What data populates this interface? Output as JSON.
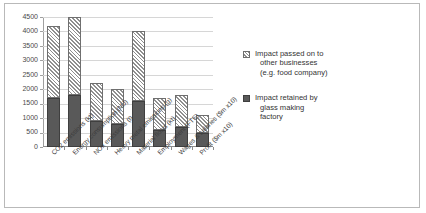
{
  "chart_data": {
    "type": "bar",
    "title": "",
    "subtitle": "",
    "xlabel": "",
    "ylabel": "",
    "stacked": true,
    "grid": true,
    "legend_position": "right",
    "ylim": [
      0,
      4500
    ],
    "yticks": [
      0,
      500,
      1000,
      1500,
      2000,
      2500,
      3000,
      3500,
      4000,
      4500
    ],
    "ytick_labels": [
      "0",
      "500",
      "1000",
      "1500",
      "2000",
      "2500",
      "3000",
      "3500",
      "4000",
      "4500"
    ],
    "categories": [
      "CO2 emissions (kt)",
      "Energy consumption (MJ)",
      "NOx emissions (t)",
      "Heavy metal emissions (g)",
      "Material flows (kt)",
      "Employment (FTE)",
      "Wages & salaries ($m x10)",
      "Profit ($m x10)"
    ],
    "series": [
      {
        "name": "Impact retained by glass making factory",
        "pattern": "solid",
        "color": "#595959",
        "values": [
          1700,
          1800,
          900,
          800,
          1600,
          600,
          700,
          500
        ]
      },
      {
        "name": "Impact passed on to other businesses (e.g. food company)",
        "pattern": "diagonal-hatch",
        "color": "#ffffff",
        "values": [
          2500,
          2700,
          1300,
          1200,
          2400,
          1100,
          1100,
          600
        ]
      }
    ],
    "totals": [
      4200,
      4500,
      2200,
      2000,
      4000,
      1700,
      1800,
      1100
    ]
  },
  "axis": {
    "y_tick_labels": [
      "4500",
      "4000",
      "3500",
      "3000",
      "2500",
      "2000",
      "1500",
      "1000",
      "500",
      "0"
    ]
  },
  "legend": {
    "entries": [
      {
        "swatch": "hatched-swatch",
        "line1": "Impact passed on to",
        "line2": "other businesses",
        "line3": "(e.g. food company)"
      },
      {
        "swatch": "solid-swatch",
        "line1": "Impact retained by",
        "line2": "glass making",
        "line3": "factory"
      }
    ]
  }
}
